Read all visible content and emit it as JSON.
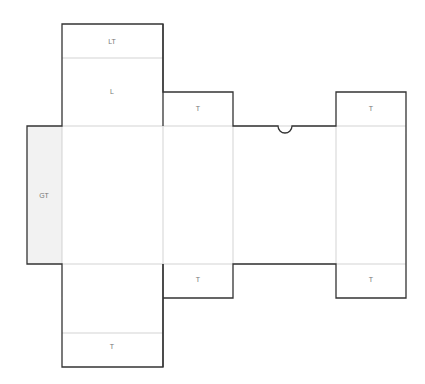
{
  "diagram": {
    "type": "box-dieline",
    "colors": {
      "cut": "#333333",
      "fold": "#c8c8c8",
      "glue_fill": "#f2f2f2",
      "label": "#777777"
    },
    "labels": {
      "lid_tuck": "LT",
      "lid": "L",
      "top_tuck_1": "T",
      "top_tuck_2": "T",
      "glue_tab": "GT",
      "bottom_tuck_1": "T",
      "bottom_tuck_2": "T",
      "bottom_flap": "T"
    }
  }
}
